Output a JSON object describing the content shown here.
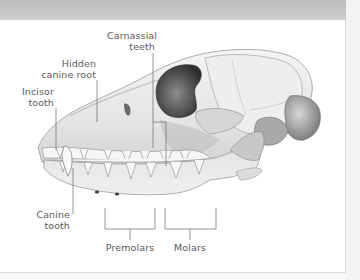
{
  "figure": {
    "labels": {
      "carnassial": [
        "Carnassial",
        "teeth"
      ],
      "hidden_canine": [
        "Hidden",
        "canine root"
      ],
      "incisor": [
        "Incisor",
        "tooth"
      ],
      "canine": [
        "Canine",
        "tooth"
      ],
      "premolars": "Premolars",
      "molars": "Molars"
    },
    "colors": {
      "label_text": "#5a5a5a",
      "leader_line": "#6a6a6a",
      "bone_light": "#ececec",
      "bone_shadow": "#8a8a8a",
      "orbit": "#4a4a4a"
    }
  }
}
